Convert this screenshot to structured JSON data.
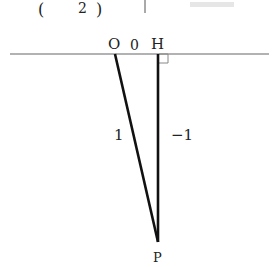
{
  "header_fragment": {
    "open_paren": "(",
    "number": "2",
    "close_paren": ")",
    "bar": "|"
  },
  "diagram": {
    "points": {
      "O": {
        "label": "O",
        "x": 115,
        "y": 54
      },
      "H": {
        "label": "H",
        "x": 158,
        "y": 54
      },
      "P": {
        "label": "P",
        "x": 158,
        "y": 242
      }
    },
    "labels": {
      "origin_value": "0",
      "OP_length": "1",
      "HP_length": "−1"
    },
    "right_angle_mark_at": "H",
    "colors": {
      "line": "#111111",
      "axis": "#666666",
      "mark": "#888888"
    }
  }
}
